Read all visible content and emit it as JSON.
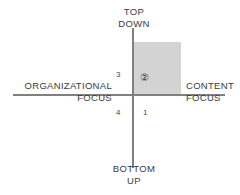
{
  "diagram": {
    "axes": {
      "vertical": {
        "top_label": "TOP\nDOWN",
        "bottom_label": "BOTTOM\nUP"
      },
      "horizontal": {
        "left_label": "ORGANIZATIONAL\nFOCUS",
        "right_label": "CONTENT\nFOCUS"
      }
    },
    "quadrants": [
      {
        "id": "1",
        "label": "1",
        "position": "lower-right",
        "highlighted": false
      },
      {
        "id": "2",
        "label": "②",
        "position": "upper-right",
        "highlighted": true
      },
      {
        "id": "3",
        "label": "3",
        "position": "upper-left",
        "highlighted": false
      },
      {
        "id": "4",
        "label": "4",
        "position": "lower-left",
        "highlighted": false
      }
    ],
    "highlight": {
      "quadrant": "2",
      "fill_color": "#d3d3d3"
    },
    "colors": {
      "background": "#ffffff",
      "axis": "#808080",
      "text": "#3a3a3a",
      "highlight_fill": "#d3d3d3"
    }
  }
}
